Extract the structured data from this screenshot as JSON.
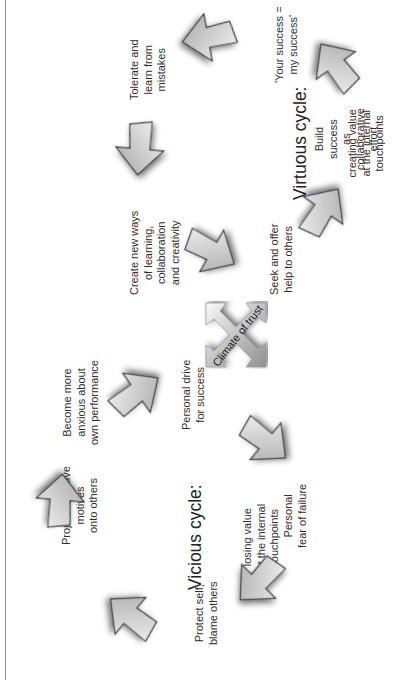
{
  "diagram": {
    "center": {
      "label": "Climate of trust"
    },
    "virtuous_cycle": {
      "title": "Virtuous cycle:",
      "subtitle": "creating value\nat the internal\ntouchpoints",
      "steps": [
        "Seek and offer\nhelp to others",
        "Build\nsuccess\nas\ncollaborative\neffort",
        "'Your success =\nmy success'",
        "Tolerate and\nlearn from\nmistakes",
        "Create new ways\nof learning,\ncollaboration\nand creativity"
      ]
    },
    "vicious_cycle": {
      "title": "Vicious cycle:",
      "subtitle": "losing value\nat the internal\ntouchpoints",
      "steps": [
        "Personal drive\nfor success",
        "Personal\nfear of failure",
        "Protect self,\nblame others",
        "Project negative\nmotives\nonto others",
        "Become more\nanxious about\nown performance"
      ]
    },
    "colors": {
      "arrow_fill_light": "#f4f4f4",
      "arrow_fill_dark": "#a9a9a9",
      "arrow_stroke": "#3a3a3a",
      "text": "#2e2e2e",
      "frame_line": "#8a8a8a"
    }
  }
}
